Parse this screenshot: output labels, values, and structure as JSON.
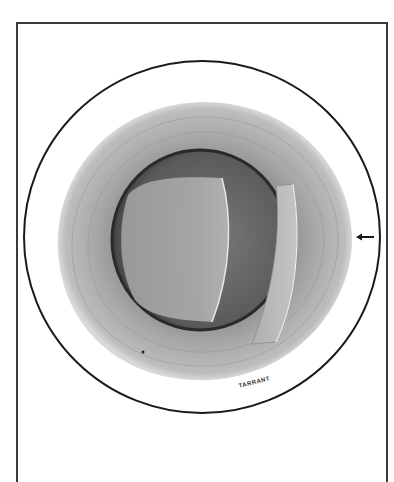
{
  "figure": {
    "signature": "TARRANT",
    "colors": {
      "outline": "#1a1a1a",
      "iris": "#a9a9a9",
      "pupil_dark": "#5e5e5e",
      "lens": "#9a9a9a",
      "background": "#ffffff"
    },
    "annotations": [
      {
        "type": "arrow",
        "direction": "left",
        "target": "limbus"
      }
    ]
  }
}
